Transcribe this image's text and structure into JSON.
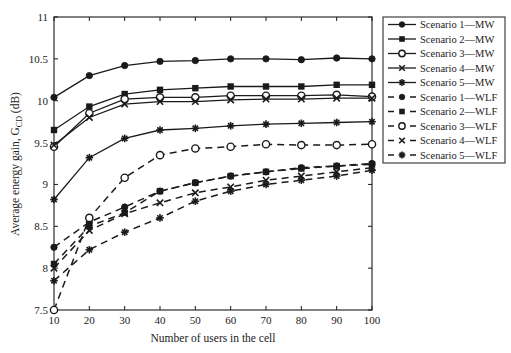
{
  "chart_data": {
    "type": "line",
    "title": "",
    "xlabel": "Number of users in the cell",
    "ylabel": "Average energy gain, G",
    "ylabel_sub": "CD",
    "ylabel_unit": " (dB)",
    "xlim": [
      10,
      100
    ],
    "ylim": [
      7.5,
      11
    ],
    "x_ticks": [
      10,
      20,
      30,
      40,
      50,
      60,
      70,
      80,
      90,
      100
    ],
    "y_ticks": [
      7.5,
      8,
      8.5,
      9,
      9.5,
      10,
      10.5,
      11
    ],
    "y_tick_labels": [
      "7.5",
      "8",
      "8.5",
      "9",
      "9.5",
      "10",
      "10.5",
      "11"
    ],
    "grid": false,
    "legend_position": "outside-right-top",
    "x": [
      10,
      20,
      30,
      40,
      50,
      60,
      70,
      80,
      90,
      100
    ],
    "series": [
      {
        "name": "Scenario 1—MW",
        "marker": "filled-circle",
        "line": "solid",
        "values": [
          10.04,
          10.3,
          10.42,
          10.47,
          10.48,
          10.5,
          10.5,
          10.49,
          10.51,
          10.5
        ]
      },
      {
        "name": "Scenario 2—MW",
        "marker": "filled-square",
        "line": "solid",
        "values": [
          9.65,
          9.93,
          10.08,
          10.13,
          10.15,
          10.17,
          10.17,
          10.17,
          10.19,
          10.19
        ]
      },
      {
        "name": "Scenario 3—MW",
        "marker": "open-circle",
        "line": "solid",
        "values": [
          9.45,
          9.85,
          10.02,
          10.04,
          10.04,
          10.06,
          10.06,
          10.06,
          10.07,
          10.05
        ]
      },
      {
        "name": "Scenario 4—MW",
        "marker": "x",
        "line": "solid",
        "values": [
          9.47,
          9.8,
          9.96,
          9.99,
          9.99,
          10.01,
          10.02,
          10.02,
          10.03,
          10.03
        ]
      },
      {
        "name": "Scenario 5—MW",
        "marker": "star",
        "line": "solid",
        "values": [
          8.82,
          9.32,
          9.55,
          9.65,
          9.67,
          9.7,
          9.72,
          9.73,
          9.74,
          9.75
        ]
      },
      {
        "name": "Scenario 1—WLF",
        "marker": "filled-circle",
        "line": "dashed",
        "values": [
          8.25,
          8.55,
          8.73,
          8.92,
          9.02,
          9.1,
          9.15,
          9.2,
          9.22,
          9.25
        ]
      },
      {
        "name": "Scenario 2—WLF",
        "marker": "filled-square",
        "line": "dashed",
        "values": [
          8.05,
          8.5,
          8.66,
          8.92,
          9.02,
          9.1,
          9.15,
          9.19,
          9.22,
          9.24
        ]
      },
      {
        "name": "Scenario 3—WLF",
        "marker": "open-circle",
        "line": "dashed",
        "values": [
          7.5,
          8.6,
          9.08,
          9.35,
          9.43,
          9.45,
          9.48,
          9.47,
          9.47,
          9.48
        ]
      },
      {
        "name": "Scenario 4—WLF",
        "marker": "x",
        "line": "dashed",
        "values": [
          8.0,
          8.45,
          8.65,
          8.78,
          8.9,
          8.97,
          9.05,
          9.1,
          9.15,
          9.2
        ]
      },
      {
        "name": "Scenario 5—WLF",
        "marker": "star",
        "line": "dashed",
        "values": [
          7.85,
          8.22,
          8.43,
          8.6,
          8.8,
          8.92,
          9.0,
          9.05,
          9.1,
          9.17
        ]
      }
    ]
  },
  "style": {
    "line_color": "#1a1a1a",
    "background": "#ffffff"
  }
}
